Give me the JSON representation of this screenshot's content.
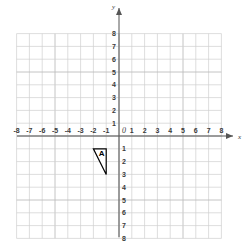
{
  "chart_data": {
    "type": "scatter",
    "title": "",
    "xlabel": "x",
    "ylabel": "y",
    "xlim": [
      -8,
      8
    ],
    "ylim": [
      -8,
      8
    ],
    "grid": true,
    "legend": false,
    "x_tick_labels": [
      "-8",
      "-7",
      "-6",
      "-5",
      "-4",
      "-3",
      "-2",
      "-1",
      "1",
      "2",
      "3",
      "4",
      "5",
      "6",
      "7",
      "8"
    ],
    "y_tick_labels_positive": [
      "1",
      "2",
      "3",
      "4",
      "5",
      "6",
      "7",
      "8"
    ],
    "y_tick_labels_negative": [
      "1",
      "2",
      "3",
      "4",
      "5",
      "6",
      "7",
      "8"
    ],
    "origin_label": "0",
    "shapes": [
      {
        "name": "A",
        "kind": "triangle",
        "label": "A",
        "vertices": [
          [
            -2,
            -1
          ],
          [
            -1,
            -1
          ],
          [
            -1,
            -3
          ]
        ],
        "fill": "#ffffff",
        "stroke": "#000000"
      }
    ],
    "annotations": [
      {
        "text": "A",
        "x": -1.35,
        "y": -1.55
      }
    ],
    "colors": {
      "background": "#ffffff",
      "grid_line": "#d0d0d0",
      "grid_line_major": "#bdbdbd",
      "axis": "#555555",
      "tick_text": "#3a3a3a",
      "shape_stroke": "#000000",
      "shape_fill": "#ffffff"
    }
  },
  "axes": {
    "x_axis_name": "x",
    "y_axis_name": "y"
  }
}
